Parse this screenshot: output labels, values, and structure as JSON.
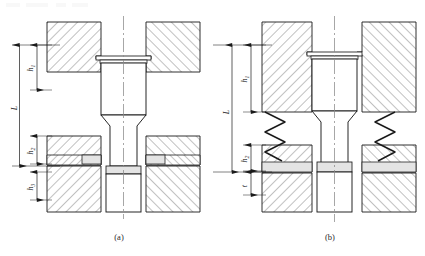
{
  "drawing": {
    "title": "Ejector pin mounting cross-sections",
    "background": "#ffffff",
    "line_color": "#1a1a1a",
    "hatch_color": "#4a4a4a",
    "fill_light": "#ffffff",
    "fill_shade": "#e2e2e2",
    "center_line_color": "#7a7a7a"
  },
  "figures": [
    {
      "id": "fig-a",
      "caption": "(a)",
      "description": "Ejector pin without return spring",
      "has_springs": false,
      "dimensions": [
        {
          "name": "L",
          "label": "L",
          "sub": "",
          "kind": "overall-length"
        },
        {
          "name": "h1",
          "label": "h",
          "sub": "1",
          "kind": "upper-plate-thickness"
        },
        {
          "name": "h2",
          "label": "h",
          "sub": "2",
          "kind": "middle-plate-thickness"
        },
        {
          "name": "h3",
          "label": "h",
          "sub": "3",
          "kind": "lower-plate-thickness"
        }
      ]
    },
    {
      "id": "fig-b",
      "caption": "(b)",
      "description": "Ejector pin with return springs",
      "has_springs": true,
      "spring_count": 2,
      "spring_coils": 4,
      "dimensions": [
        {
          "name": "L",
          "label": "L",
          "sub": "",
          "kind": "overall-length"
        },
        {
          "name": "h1",
          "label": "h",
          "sub": "1",
          "kind": "upper-plate-thickness"
        },
        {
          "name": "h2",
          "label": "h",
          "sub": "2",
          "kind": "middle-plate-thickness"
        },
        {
          "name": "t",
          "label": "t",
          "sub": "",
          "kind": "bottom-clearance"
        }
      ]
    }
  ]
}
